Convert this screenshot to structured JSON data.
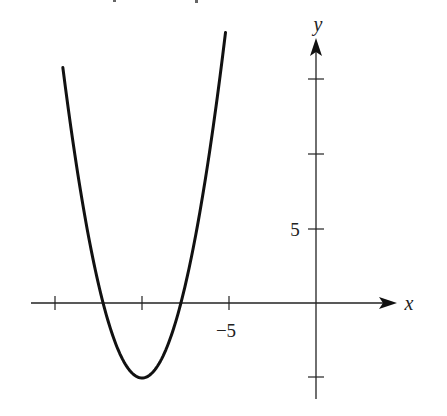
{
  "chart_data": {
    "type": "line",
    "title": "",
    "xlabel": "x",
    "ylabel": "y",
    "function": "y = (x + 10)^2 - 5",
    "vertex": [
      -10,
      -5
    ],
    "x_intercepts": [
      -12.24,
      -7.76
    ],
    "xlim": [
      -16.5,
      4.6
    ],
    "ylim": [
      -6.5,
      17.6
    ],
    "x_ticks": [
      {
        "value": -15,
        "label": ""
      },
      {
        "value": -10,
        "label": ""
      },
      {
        "value": -5,
        "label": "−5"
      }
    ],
    "y_ticks": [
      {
        "value": -5,
        "label": ""
      },
      {
        "value": 5,
        "label": "5"
      },
      {
        "value": 10,
        "label": ""
      },
      {
        "value": 15,
        "label": ""
      }
    ],
    "grid": false,
    "legend": null,
    "series": [
      {
        "name": "parabola",
        "x": [
          -14.5,
          -14,
          -13,
          -12.24,
          -12,
          -11,
          -10,
          -9,
          -8,
          -7.76,
          -7,
          -6,
          -5.3
        ],
        "y": [
          15.25,
          11,
          4,
          0,
          -1,
          -4,
          -5,
          -4,
          -1,
          0,
          4,
          11,
          17.1
        ]
      }
    ]
  },
  "axes": {
    "x_label": "x",
    "y_label": "y"
  },
  "tick_labels": {
    "x_neg5": "−5",
    "y_5": "5"
  },
  "style": {
    "curve_color": "#111111",
    "axis_color": "#222222",
    "background": "#ffffff"
  }
}
